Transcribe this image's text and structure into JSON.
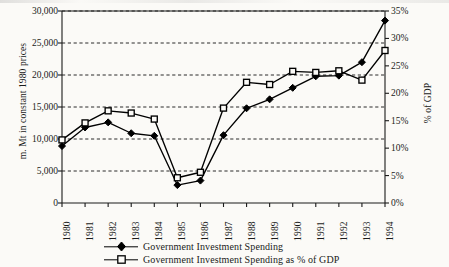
{
  "chart_data": {
    "type": "line",
    "title": "",
    "subtitle": "",
    "xlabel": "",
    "ylabel": "m. Mt in constant 1980 prices",
    "ylabel_secondary": "% of GDP",
    "categories": [
      "1980",
      "1981",
      "1982",
      "1983",
      "1984",
      "1985",
      "1986",
      "1987",
      "1988",
      "1989",
      "1990",
      "1991",
      "1992",
      "1993",
      "1994"
    ],
    "x": [
      1980,
      1981,
      1982,
      1983,
      1984,
      1985,
      1986,
      1987,
      1988,
      1989,
      1990,
      1991,
      1992,
      1993,
      1994
    ],
    "ylim": [
      0,
      30000
    ],
    "ylim_secondary": [
      0,
      35
    ],
    "yticks": [
      0,
      5000,
      10000,
      15000,
      20000,
      25000,
      30000
    ],
    "ytick_labels": [
      "0",
      "5,000",
      "10,000",
      "15,000",
      "20,000",
      "25,000",
      "30,000"
    ],
    "yticks_secondary": [
      0,
      5,
      10,
      15,
      20,
      25,
      30,
      35
    ],
    "ytick_labels_secondary": [
      "0%",
      "5%",
      "10%",
      "15%",
      "20%",
      "25%",
      "30%",
      "35%"
    ],
    "grid": true,
    "grid_style": "dashed",
    "grid_axis": "y",
    "legend_position": "bottom",
    "series": [
      {
        "name": "Government Investment Spending",
        "axis": "left",
        "marker": "filled-diamond",
        "unit": "m. Mt in constant 1980 prices",
        "values": [
          8900,
          11800,
          12600,
          10900,
          10500,
          2800,
          3500,
          10600,
          14800,
          16200,
          18000,
          19800,
          19900,
          22000,
          28500
        ]
      },
      {
        "name": "Government Investment Spending as % of GDP",
        "axis": "right",
        "marker": "open-square",
        "unit": "% of GDP",
        "values": [
          11.5,
          14.6,
          16.8,
          16.4,
          15.3,
          4.6,
          5.6,
          17.3,
          22.0,
          21.6,
          24.0,
          23.8,
          24.1,
          22.4,
          27.8
        ]
      }
    ]
  },
  "axes": {
    "left_title": "m. Mt in constant 1980 prices",
    "right_title": "% of GDP",
    "left_ticks": [
      "30,000",
      "25,000",
      "20,000",
      "15,000",
      "10,000",
      "5,000",
      "0"
    ],
    "right_ticks": [
      "35%",
      "30%",
      "25%",
      "20%",
      "15%",
      "10%",
      "5%",
      "0%"
    ],
    "x_ticks": [
      "1980",
      "1981",
      "1982",
      "1983",
      "1984",
      "1985",
      "1986",
      "1987",
      "1988",
      "1989",
      "1990",
      "1991",
      "1992",
      "1993",
      "1994"
    ]
  },
  "legend": {
    "items": [
      {
        "label": "Government Investment Spending",
        "marker": "filled-diamond"
      },
      {
        "label": "Government Investment Spending as % of GDP",
        "marker": "open-square"
      }
    ]
  },
  "style": {
    "background": "#fbfaf7",
    "ink": "#1a1a1a",
    "grid_color": "#2b2b2b",
    "series_color": "#000000"
  }
}
